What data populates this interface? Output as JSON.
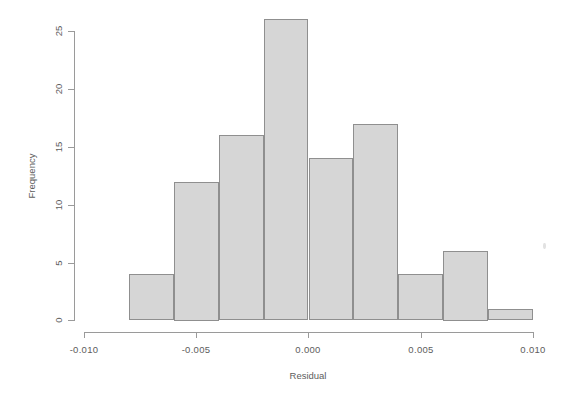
{
  "chart_data": {
    "type": "bar",
    "title": "",
    "subtitle": "",
    "xlabel": "Residual",
    "ylabel": "Frequency",
    "xlim": [
      -0.01,
      0.01
    ],
    "ylim": [
      0,
      26
    ],
    "grid": false,
    "legend": null,
    "bin_width": 0.002,
    "bin_edges": [
      -0.008,
      -0.006,
      -0.004,
      -0.002,
      0.0,
      0.002,
      0.004,
      0.006,
      0.008,
      0.01
    ],
    "categories": [
      "-0.008 to -0.006",
      "-0.006 to -0.004",
      "-0.004 to -0.002",
      "-0.002 to 0.000",
      "0.000 to 0.002",
      "0.002 to 0.004",
      "0.004 to 0.006",
      "0.006 to 0.008",
      "0.008 to 0.010"
    ],
    "values": [
      4,
      12,
      16,
      26,
      14,
      17,
      4,
      6,
      1
    ],
    "xticks": [
      -0.01,
      -0.005,
      0.0,
      0.005,
      0.01
    ],
    "xtick_labels": [
      "-0.010",
      "-0.005",
      "0.000",
      "0.005",
      "0.010"
    ],
    "yticks": [
      0,
      5,
      10,
      15,
      20,
      25
    ],
    "ytick_labels": [
      "0",
      "5",
      "10",
      "15",
      "20",
      "25"
    ],
    "colors": {
      "bar_fill": "#d6d6d6",
      "bar_border": "#8f8f8f",
      "axis": "#9a9a9a",
      "text": "#5d5d5d",
      "background": "#ffffff"
    }
  }
}
